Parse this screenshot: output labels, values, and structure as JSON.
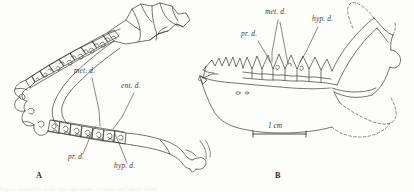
{
  "figure": {
    "background_color": "#fdfdfb",
    "ink_color": "#3a3a3a",
    "caption_sliver": "Fig. — mandible of the type specimen, occlusal and lateral views"
  },
  "panels": [
    {
      "id": "A",
      "letter": "A",
      "view": "occlusal view of mandible",
      "labels": [
        {
          "key": "met_d",
          "text": "met. d.",
          "name": "metaconid",
          "x": 74,
          "y": 71
        },
        {
          "key": "ent_d",
          "text": "ent. d.",
          "name": "entoconid",
          "x": 121,
          "y": 86
        },
        {
          "key": "pr_d",
          "text": "pr. d.",
          "name": "protoconid",
          "x": 68,
          "y": 157
        },
        {
          "key": "hyp_d",
          "text": "hyp. d.",
          "name": "hypoconid",
          "x": 114,
          "y": 166
        }
      ]
    },
    {
      "id": "B",
      "letter": "B",
      "view": "lateral view of mandible",
      "labels": [
        {
          "key": "met_d",
          "text": "met. d.",
          "name": "metaconid",
          "x": 265,
          "y": 12
        },
        {
          "key": "hyp_d",
          "text": "hyp. d.",
          "name": "hypoconid",
          "x": 312,
          "y": 19
        },
        {
          "key": "pr_d",
          "text": "pr. d.",
          "name": "protoconid",
          "x": 241,
          "y": 34
        }
      ],
      "scale_bar": {
        "text": "1 cm",
        "label_x": 272,
        "label_y": 121,
        "x1": 253,
        "x2": 306,
        "y": 134
      }
    }
  ],
  "panel_letter_positions": [
    {
      "id": "A",
      "x": 36,
      "y": 174
    },
    {
      "id": "B",
      "x": 275,
      "y": 174
    }
  ]
}
